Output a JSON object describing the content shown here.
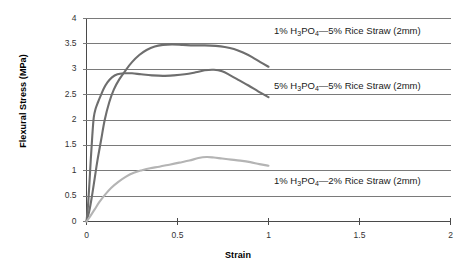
{
  "chart_data": {
    "type": "line",
    "title": "",
    "xlabel": "Strain",
    "ylabel": "Flexural Stress (MPa)",
    "xlim": [
      0,
      2
    ],
    "ylim": [
      0,
      4
    ],
    "xticks": [
      "0",
      "0.5",
      "1",
      "1.5",
      "2"
    ],
    "xtick_values": [
      0,
      0.5,
      1,
      1.5,
      2
    ],
    "yticks": [
      "0",
      "0.5",
      "1",
      "1.5",
      "2",
      "2.5",
      "3",
      "3.5",
      "4"
    ],
    "ytick_values": [
      0,
      0.5,
      1,
      1.5,
      2,
      2.5,
      3,
      3.5,
      4
    ],
    "grid": "horizontal",
    "legend": "inline-annotations",
    "series": [
      {
        "name": "1% H3PO4-5% Rice Straw (2mm)",
        "label_html": "1% H<sub>3</sub>PO<sub>4</sub>—5% Rice Straw (2mm)",
        "color": "#6e6e6e",
        "points": [
          [
            0.0,
            0.0
          ],
          [
            0.015,
            0.2
          ],
          [
            0.03,
            0.5
          ],
          [
            0.045,
            0.85
          ],
          [
            0.06,
            1.2
          ],
          [
            0.08,
            1.6
          ],
          [
            0.1,
            2.0
          ],
          [
            0.125,
            2.35
          ],
          [
            0.15,
            2.6
          ],
          [
            0.18,
            2.8
          ],
          [
            0.215,
            2.98
          ],
          [
            0.25,
            3.14
          ],
          [
            0.29,
            3.28
          ],
          [
            0.33,
            3.38
          ],
          [
            0.375,
            3.45
          ],
          [
            0.42,
            3.48
          ],
          [
            0.47,
            3.49
          ],
          [
            0.53,
            3.48
          ],
          [
            0.59,
            3.47
          ],
          [
            0.65,
            3.47
          ],
          [
            0.71,
            3.46
          ],
          [
            0.76,
            3.44
          ],
          [
            0.81,
            3.4
          ],
          [
            0.86,
            3.33
          ],
          [
            0.91,
            3.24
          ],
          [
            0.955,
            3.14
          ],
          [
            1.0,
            3.05
          ]
        ]
      },
      {
        "name": "5% H3PO4-5% Rice Straw (2mm)",
        "label_html": "5% H<sub>3</sub>PO<sub>4</sub>—5% Rice Straw (2mm)",
        "color": "#6e6e6e",
        "points": [
          [
            0.0,
            0.0
          ],
          [
            0.008,
            0.3
          ],
          [
            0.016,
            0.75
          ],
          [
            0.024,
            1.25
          ],
          [
            0.032,
            1.7
          ],
          [
            0.04,
            2.05
          ],
          [
            0.05,
            2.22
          ],
          [
            0.062,
            2.34
          ],
          [
            0.078,
            2.48
          ],
          [
            0.095,
            2.62
          ],
          [
            0.115,
            2.74
          ],
          [
            0.14,
            2.84
          ],
          [
            0.17,
            2.9
          ],
          [
            0.205,
            2.92
          ],
          [
            0.25,
            2.92
          ],
          [
            0.3,
            2.9
          ],
          [
            0.36,
            2.88
          ],
          [
            0.42,
            2.87
          ],
          [
            0.48,
            2.88
          ],
          [
            0.54,
            2.9
          ],
          [
            0.6,
            2.94
          ],
          [
            0.65,
            2.98
          ],
          [
            0.7,
            2.99
          ],
          [
            0.745,
            2.96
          ],
          [
            0.79,
            2.88
          ],
          [
            0.84,
            2.78
          ],
          [
            0.89,
            2.68
          ],
          [
            0.945,
            2.56
          ],
          [
            1.0,
            2.45
          ]
        ]
      },
      {
        "name": "1% H3PO4-2% Rice Straw (2mm)",
        "label_html": "1% H<sub>3</sub>PO<sub>4</sub>—2% Rice Straw (2mm)",
        "color": "#b4b4b4",
        "points": [
          [
            0.0,
            0.0
          ],
          [
            0.02,
            0.1
          ],
          [
            0.045,
            0.24
          ],
          [
            0.07,
            0.38
          ],
          [
            0.1,
            0.52
          ],
          [
            0.135,
            0.66
          ],
          [
            0.175,
            0.78
          ],
          [
            0.215,
            0.88
          ],
          [
            0.26,
            0.96
          ],
          [
            0.305,
            1.01
          ],
          [
            0.35,
            1.05
          ],
          [
            0.4,
            1.08
          ],
          [
            0.455,
            1.12
          ],
          [
            0.51,
            1.16
          ],
          [
            0.565,
            1.2
          ],
          [
            0.615,
            1.25
          ],
          [
            0.66,
            1.27
          ],
          [
            0.7,
            1.26
          ],
          [
            0.745,
            1.24
          ],
          [
            0.795,
            1.22
          ],
          [
            0.845,
            1.2
          ],
          [
            0.9,
            1.17
          ],
          [
            0.95,
            1.13
          ],
          [
            1.0,
            1.1
          ]
        ]
      }
    ],
    "annotations": [
      {
        "name": "annotation-1pct-5pct",
        "text": "1% H3PO4-5% Rice Straw (2mm)",
        "x_px": 274,
        "y_px": 25
      },
      {
        "name": "annotation-5pct-5pct",
        "text": "5% H3PO4-5% Rice Straw (2mm)",
        "x_px": 274,
        "y_px": 80
      },
      {
        "name": "annotation-1pct-2pct",
        "text": "1% H3PO4-2% Rice Straw (2mm)",
        "x_px": 274,
        "y_px": 175
      }
    ]
  }
}
